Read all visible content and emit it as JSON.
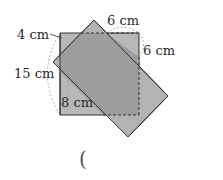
{
  "figure": {
    "labels": {
      "top": "6 cm",
      "top_left": "4 cm",
      "right": "6 cm",
      "left": "15 cm",
      "inner_left": "8 cm"
    },
    "answer_paren": "(",
    "colors": {
      "square_fill": "#b5b5b5",
      "rect_fill": "#b0b0b0",
      "overlap_fill": "#9a9a9a",
      "stroke": "#333333",
      "dashed": "#333333",
      "brace": "#999999"
    }
  }
}
